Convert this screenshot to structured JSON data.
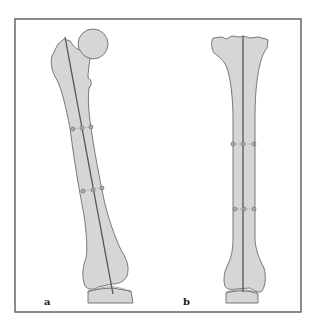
{
  "figure": {
    "panels": [
      {
        "id": "a",
        "label": "a",
        "bone": "femur",
        "description": "Femur, anterior view, with mechanical/anatomical axis line and two rows of three measurement points across the shaft"
      },
      {
        "id": "b",
        "label": "b",
        "bone": "tibia",
        "description": "Tibia, anterior view, with vertical axis line and two rows of three measurement points across the shaft"
      }
    ],
    "colors": {
      "bone_fill": "#d6d6d6",
      "outline": "#6b6b6b",
      "axis_line": "#555555",
      "frame": "#5a5a5a",
      "marker_fill": "#a8a8a8",
      "background": "#ffffff"
    }
  }
}
